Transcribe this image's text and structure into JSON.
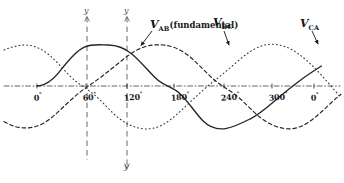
{
  "figure": {
    "axis_color": "#3d3d3d",
    "curve_color": "#2b2b2b",
    "guide_color": "#555555",
    "baseline_y_px": 86,
    "amplitude_px": 41
  },
  "axis": {
    "y_label_top_left": "y",
    "y_label_top_right": "y",
    "y_label_bottom_right": "y",
    "ticks": [
      {
        "label": "0",
        "deg": "°",
        "x": 37
      },
      {
        "label": "60",
        "deg": "°",
        "x": 86
      },
      {
        "label": "120",
        "deg": "°",
        "x": 127
      },
      {
        "label": "180",
        "deg": "°",
        "x": 174
      },
      {
        "label": "240",
        "deg": "°",
        "x": 224
      },
      {
        "label": "300",
        "deg": "°",
        "x": 272
      },
      {
        "label": "0",
        "deg": "°",
        "x": 314
      }
    ]
  },
  "labels": {
    "vab": {
      "v": "V",
      "sub": "AB",
      "note": "(fundamental)"
    },
    "vbc": {
      "v": "V",
      "sub": "BC"
    },
    "vca": {
      "v": "V",
      "sub": "CA"
    }
  },
  "chart_data": {
    "type": "line",
    "xlabel": "Electrical degrees",
    "ylabel": "Voltage",
    "xlim": [
      -30,
      390
    ],
    "ylim": [
      -1.1,
      1.1
    ],
    "grid": false,
    "legend": "inline-annotations",
    "x_ticks": [
      0,
      60,
      120,
      180,
      240,
      300,
      360
    ],
    "x_tick_labels": [
      "0°",
      "60°",
      "120°",
      "180°",
      "240°",
      "300°",
      "0°"
    ],
    "vertical_reference_lines_deg": [
      60,
      120
    ],
    "series": [
      {
        "name": "V_AB (fundamental)",
        "style": "solid",
        "phase_deg": 0,
        "amplitude": 1.0,
        "x": [
          0,
          30,
          60,
          90,
          120,
          150,
          180,
          210,
          240,
          270,
          300,
          330,
          360
        ],
        "values": [
          0,
          0.5,
          0.866,
          1.0,
          0.866,
          0.5,
          0,
          -0.5,
          -0.866,
          -1.0,
          -0.866,
          -0.5,
          0
        ]
      },
      {
        "name": "V_BC",
        "style": "dashed",
        "phase_deg": -120,
        "amplitude": 1.0,
        "x": [
          0,
          30,
          60,
          90,
          120,
          150,
          180,
          210,
          240,
          270,
          300,
          330,
          360
        ],
        "values": [
          -0.866,
          -1.0,
          -0.866,
          -0.5,
          0,
          0.5,
          0.866,
          1.0,
          0.866,
          0.5,
          0,
          -0.5,
          -0.866
        ]
      },
      {
        "name": "V_CA",
        "style": "dotted",
        "phase_deg": 120,
        "amplitude": 1.0,
        "x": [
          0,
          30,
          60,
          90,
          120,
          150,
          180,
          210,
          240,
          270,
          300,
          330,
          360
        ],
        "values": [
          0.866,
          0.5,
          0,
          -0.5,
          -0.866,
          -1.0,
          -0.866,
          -0.5,
          0,
          0.5,
          0.866,
          1.0,
          0.866
        ]
      }
    ],
    "annotations": [
      {
        "text": "V_AB (fundamental)",
        "points_to_deg": 105,
        "position": "above-curve"
      },
      {
        "text": "V_BC",
        "points_to_deg": 185,
        "position": "above-curve"
      },
      {
        "text": "V_CA",
        "points_to_deg": 320,
        "position": "above-curve"
      }
    ]
  }
}
